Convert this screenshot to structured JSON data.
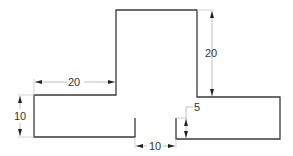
{
  "drawing": {
    "colors": {
      "outline": "#3a3a3a",
      "dimension_line": "#b0b0b0",
      "text": "#333333",
      "background": "#ffffff"
    },
    "dimensions": {
      "tower_height": "20",
      "left_step_width": "20",
      "left_height": "10",
      "gap_width": "10",
      "right_offset": "5"
    }
  }
}
